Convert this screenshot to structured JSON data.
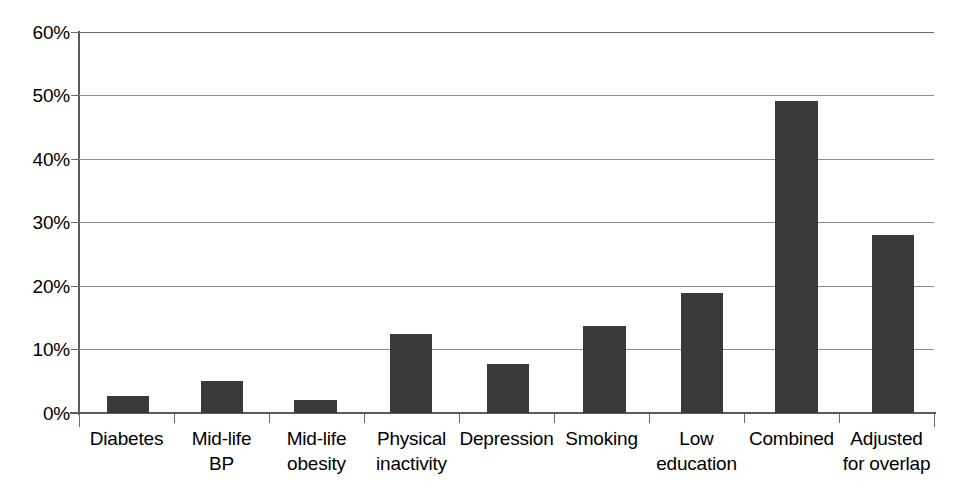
{
  "chart_data": {
    "type": "bar",
    "title": "",
    "subtitle": "",
    "xlabel": "",
    "ylabel": "",
    "categories": [
      "Diabetes",
      "Mid-life BP",
      "Mid-life obesity",
      "Physical inactivity",
      "Depression",
      "Smoking",
      "Low education",
      "Combined",
      "Adjusted for overlap"
    ],
    "values": [
      2.7,
      5.0,
      2.0,
      12.4,
      7.7,
      13.7,
      18.9,
      49.2,
      28.0
    ],
    "ylim": [
      0,
      60
    ],
    "yticks": [
      0,
      10,
      20,
      30,
      40,
      50,
      60
    ],
    "ytick_labels": [
      "0%",
      "10%",
      "20%",
      "30%",
      "40%",
      "50%",
      "60%"
    ],
    "grid": true,
    "legend": "none",
    "bar_color": "#3a3a3a",
    "gridline_color": "#8d8d8d",
    "axis_color": "#5a5a5a",
    "background_color": "#ffffff"
  },
  "axis": {
    "y_tick_0": "0%",
    "y_tick_1": "10%",
    "y_tick_2": "20%",
    "y_tick_3": "30%",
    "y_tick_4": "40%",
    "y_tick_5": "50%",
    "y_tick_6": "60%"
  },
  "categories": {
    "c0_line1": "Diabetes",
    "c0_line2": "",
    "c1_line1": "Mid-life",
    "c1_line2": "BP",
    "c2_line1": "Mid-life",
    "c2_line2": "obesity",
    "c3_line1": "Physical",
    "c3_line2": "inactivity",
    "c4_line1": "Depression",
    "c4_line2": "",
    "c5_line1": "Smoking",
    "c5_line2": "",
    "c6_line1": "Low",
    "c6_line2": "education",
    "c7_line1": "Combined",
    "c7_line2": "",
    "c8_line1": "Adjusted",
    "c8_line2": "for overlap"
  }
}
